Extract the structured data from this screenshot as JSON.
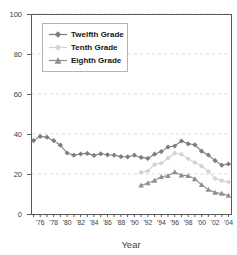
{
  "chart_data": {
    "type": "line",
    "title": "",
    "xlabel": "Year",
    "ylabel": "",
    "ylim": [
      0,
      100
    ],
    "y_ticks": [
      0,
      20,
      40,
      60,
      80,
      100
    ],
    "x_start_year": 1975,
    "x_end_year": 2004,
    "x_tick_interval": 1,
    "x_tick_labels": [
      "'76",
      "'78",
      "'80",
      "'82",
      "'84",
      "'86",
      "'88",
      "'90",
      "'92",
      "'94",
      "'96",
      "'98",
      "'00",
      "'02",
      "'04"
    ],
    "grid": "horizontal-dashed",
    "legend_position": "top-left",
    "axis_color": "#5a5a5a",
    "grid_color": "#d9d9d9",
    "text_color": "#404040",
    "series": [
      {
        "name": "Twelfth Grade",
        "marker": "diamond",
        "color": "#7d7d7d",
        "start_year": 1975,
        "values": [
          36.7,
          38.8,
          38.4,
          36.7,
          34.4,
          30.5,
          29.4,
          30.0,
          30.3,
          29.3,
          30.1,
          29.6,
          29.4,
          28.7,
          28.6,
          29.4,
          28.3,
          27.8,
          29.9,
          31.2,
          33.5,
          34.0,
          36.5,
          35.1,
          34.6,
          31.4,
          29.5,
          26.7,
          24.4,
          25.0
        ]
      },
      {
        "name": "Tenth Grade",
        "marker": "diamond",
        "color": "#d3d3d3",
        "start_year": 1991,
        "values": [
          20.8,
          21.5,
          24.7,
          25.4,
          27.9,
          30.4,
          29.8,
          27.6,
          25.7,
          23.9,
          21.3,
          17.7,
          16.7,
          16.0
        ]
      },
      {
        "name": "Eighth Grade",
        "marker": "triangle",
        "color": "#8f8f8f",
        "start_year": 1991,
        "values": [
          14.3,
          15.5,
          16.7,
          18.6,
          19.1,
          21.0,
          19.4,
          19.1,
          17.5,
          14.6,
          12.2,
          10.7,
          10.2,
          9.2
        ]
      }
    ]
  }
}
